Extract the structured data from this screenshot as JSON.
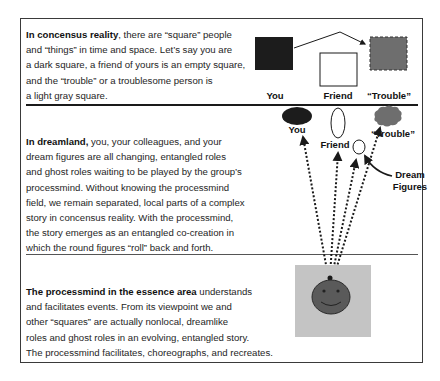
{
  "sections": [
    {
      "id": "consensus",
      "lead": "In concensus reality",
      "lines": [
        ", there are “square” people",
        " and “things” in time and space. Let’s say you are",
        " a dark square, a friend of yours is an empty square,",
        "and the “trouble” or a troublesome  person is",
        "a light gray square."
      ],
      "figure": {
        "labels": {
          "you": "You",
          "friend": "Friend",
          "trouble": "“Trouble”"
        }
      }
    },
    {
      "id": "dreamland",
      "lead": "In dreamland,",
      "lines": [
        " you, your colleagues, and your",
        "dream figures are all changing, entangled roles",
        "and ghost roles waiting to be played by the group’s",
        "processmind. Without knowing the processmind",
        "field, we remain separated, local parts of a complex",
        "story in concensus reality. With the processmind,",
        "the story emerges as an entangled co-creation in",
        "which the round figures “roll” back and forth."
      ],
      "figure": {
        "labels": {
          "you": "You",
          "friend": "Friend",
          "trouble": "“Trouble”",
          "dream_figures_1": "Dream",
          "dream_figures_2": "Figures"
        }
      }
    },
    {
      "id": "essence",
      "lead": "The processmind in the essence area",
      "lines": [
        " understands",
        "and facilitates events. From its viewpoint we and",
        "other “squares” are actually nonlocal, dreamlike",
        "roles and ghost roles in an evolving, entangled story.",
        "The processmind facilitates, choreographs, and recreates."
      ]
    }
  ],
  "colors": {
    "dark": "#1c1c1c",
    "trouble_gray": "#6e6e6e",
    "essence_bg": "#c4c4c4",
    "smiley": "#5a5a5a",
    "line": "#1a1a1a"
  }
}
